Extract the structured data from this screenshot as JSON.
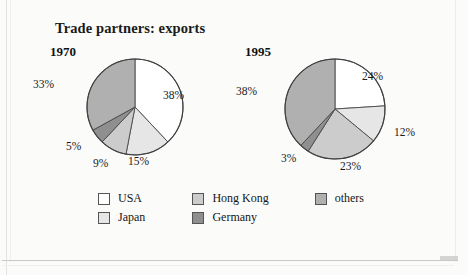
{
  "figure": {
    "title": "Trade partners: exports",
    "background": "#fbfbfa"
  },
  "legend": {
    "rows": [
      [
        {
          "label": "USA",
          "color": "#ffffff"
        },
        {
          "label": "Hong Kong",
          "color": "#cccccc"
        },
        {
          "label": "others",
          "color": "#b0b0b0"
        }
      ],
      [
        {
          "label": "Japan",
          "color": "#e6e6e6"
        },
        {
          "label": "Germany",
          "color": "#8f8f8f"
        },
        {
          "label": "",
          "color": ""
        }
      ]
    ]
  },
  "chart_data": [
    {
      "type": "pie",
      "title": "1970",
      "categories": [
        "USA",
        "Japan",
        "Hong Kong",
        "Germany",
        "others"
      ],
      "values": [
        38,
        15,
        9,
        5,
        33
      ],
      "labels": [
        "38%",
        "15%",
        "9%",
        "5%",
        "33%"
      ],
      "colors": [
        "#ffffff",
        "#e6e6e6",
        "#cccccc",
        "#8f8f8f",
        "#b0b0b0"
      ],
      "unit": "%",
      "start_angle_deg": 0,
      "direction": "clockwise",
      "legend_position": "bottom"
    },
    {
      "type": "pie",
      "title": "1995",
      "categories": [
        "USA",
        "Japan",
        "Hong Kong",
        "Germany",
        "others"
      ],
      "values": [
        24,
        12,
        23,
        3,
        38
      ],
      "labels": [
        "24%",
        "12%",
        "23%",
        "3%",
        "38%"
      ],
      "colors": [
        "#ffffff",
        "#e6e6e6",
        "#cccccc",
        "#8f8f8f",
        "#b0b0b0"
      ],
      "unit": "%",
      "start_angle_deg": 0,
      "direction": "clockwise",
      "legend_position": "bottom"
    }
  ],
  "annotations": {
    "pie_1970": {
      "usa": "38%",
      "japan": "15%",
      "hongkong": "9%",
      "germany": "5%",
      "others": "33%"
    },
    "pie_1995": {
      "usa": "24%",
      "japan": "12%",
      "hongkong": "23%",
      "germany": "3%",
      "others": "38%"
    }
  }
}
